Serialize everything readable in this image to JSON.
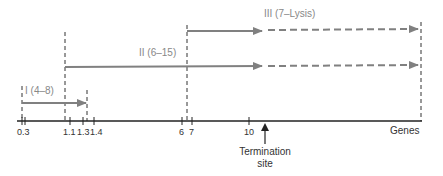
{
  "diagram": {
    "axis_label": "Genes",
    "ticks": [
      {
        "label": "0.3",
        "x": 22
      },
      {
        "label": "1.1",
        "x": 70
      },
      {
        "label": "1.3",
        "x": 83
      },
      {
        "label": "1.4",
        "x": 94
      },
      {
        "label": "6",
        "x": 182
      },
      {
        "label": "7",
        "x": 192
      },
      {
        "label": "10",
        "x": 249
      }
    ],
    "transcripts": [
      {
        "label": "I (4–8)"
      },
      {
        "label": "II (6–15)"
      },
      {
        "label": "III (7–Lysis)"
      }
    ],
    "termination_label_line1": "Termination",
    "termination_label_line2": "site",
    "colors": {
      "arrow": "#808080",
      "axis": "#222222",
      "dashed": "#333333"
    }
  }
}
